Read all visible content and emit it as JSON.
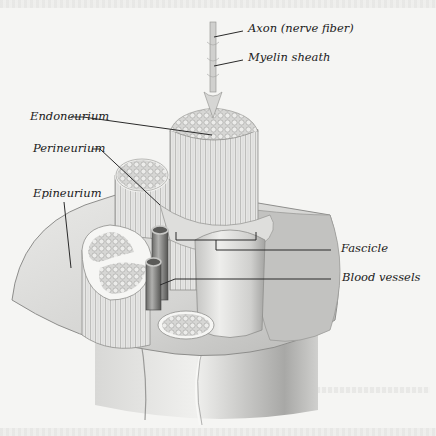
{
  "diagram": {
    "labels": {
      "axon": "Axon (nerve fiber)",
      "myelin": "Myelin sheath",
      "endoneurium": "Endoneurium",
      "perineurium": "Perineurium",
      "epineurium": "Epineurium",
      "fascicle": "Fascicle",
      "blood_vessels": "Blood vessels"
    },
    "colors": {
      "background": "#f5f5f3",
      "tissue_light": "#e8e8e6",
      "tissue_mid": "#c8c8c6",
      "tissue_dark": "#8a8a88",
      "leader_line": "#2a2a2a",
      "label_text": "#1a1a1a"
    }
  }
}
